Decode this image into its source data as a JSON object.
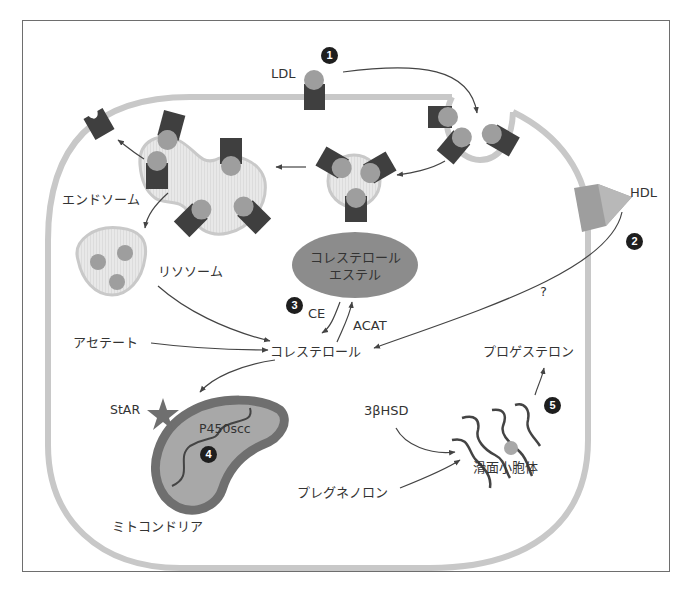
{
  "diagram": {
    "type": "cell-pathway",
    "colors": {
      "frame": "#6e6e6e",
      "membrane": "#c8c8c8",
      "receptor": "#3f3f3f",
      "ligand": "#9e9e9e",
      "vesicle_fill": "#e6e6e6",
      "vesicle_edge": "#c9c9c9",
      "pool": "#8c8c8c",
      "mito_outer": "#6f6f6f",
      "mito_inner": "#a8a8a8",
      "badge": "#1e1e1e",
      "arrow": "#444444"
    },
    "badges": [
      {
        "id": "1",
        "label": "1"
      },
      {
        "id": "2",
        "label": "2"
      },
      {
        "id": "3",
        "label": "3"
      },
      {
        "id": "4",
        "label": "4"
      },
      {
        "id": "5",
        "label": "5"
      }
    ],
    "labels": {
      "ldl": "LDL",
      "hdl": "HDL",
      "endosome": "エンドソーム",
      "lysosome": "リソソーム",
      "cholesterol_ester_line1": "コレステロール",
      "cholesterol_ester_line2": "エステル",
      "ce": "CE",
      "acat": "ACAT",
      "question": "?",
      "acetate": "アセテート",
      "cholesterol": "コレステロール",
      "progesterone": "プロゲステロン",
      "star": "StAR",
      "p450scc": "P450scc",
      "hsd": "3βHSD",
      "smooth_er": "滑面小胞体",
      "pregnenolone": "プレグネノロン",
      "mitochondria": "ミトコンドリア"
    },
    "nodes": [
      {
        "id": "ldl",
        "label": "LDL"
      },
      {
        "id": "coated-pit",
        "label": ""
      },
      {
        "id": "vesicle",
        "label": ""
      },
      {
        "id": "endosome",
        "label": "エンドソーム"
      },
      {
        "id": "recycled-receptor",
        "label": ""
      },
      {
        "id": "lysosome",
        "label": "リソソーム"
      },
      {
        "id": "hdl",
        "label": "HDL"
      },
      {
        "id": "cholesterol-ester",
        "label": "コレステロールエステル"
      },
      {
        "id": "acetate",
        "label": "アセテート"
      },
      {
        "id": "cholesterol",
        "label": "コレステロール"
      },
      {
        "id": "mitochondria",
        "label": "ミトコンドリア"
      },
      {
        "id": "star",
        "label": "StAR"
      },
      {
        "id": "p450scc",
        "label": "P450scc"
      },
      {
        "id": "pregnenolone",
        "label": "プレグネノロン"
      },
      {
        "id": "hsd",
        "label": "3βHSD"
      },
      {
        "id": "smooth-er",
        "label": "滑面小胞体"
      },
      {
        "id": "progesterone",
        "label": "プロゲステロン"
      }
    ],
    "edges": [
      {
        "from": "ldl",
        "to": "coated-pit",
        "label": ""
      },
      {
        "from": "coated-pit",
        "to": "vesicle",
        "label": ""
      },
      {
        "from": "vesicle",
        "to": "endosome",
        "label": ""
      },
      {
        "from": "endosome",
        "to": "recycled-receptor",
        "label": ""
      },
      {
        "from": "endosome",
        "to": "lysosome",
        "label": ""
      },
      {
        "from": "lysosome",
        "to": "cholesterol",
        "label": ""
      },
      {
        "from": "hdl",
        "to": "cholesterol",
        "label": "?"
      },
      {
        "from": "cholesterol-ester",
        "to": "cholesterol",
        "label": "CE"
      },
      {
        "from": "cholesterol",
        "to": "cholesterol-ester",
        "label": "ACAT"
      },
      {
        "from": "acetate",
        "to": "cholesterol",
        "label": ""
      },
      {
        "from": "cholesterol",
        "to": "mitochondria",
        "label": ""
      },
      {
        "from": "hsd",
        "to": "smooth-er",
        "label": ""
      },
      {
        "from": "pregnenolone",
        "to": "smooth-er",
        "label": ""
      },
      {
        "from": "smooth-er",
        "to": "progesterone",
        "label": ""
      }
    ]
  }
}
